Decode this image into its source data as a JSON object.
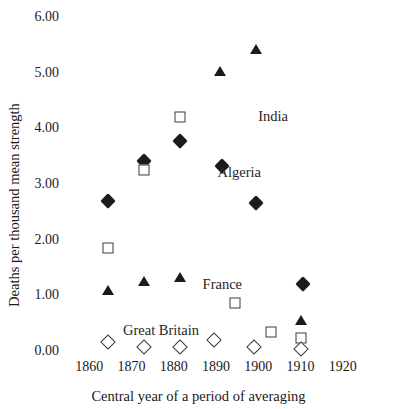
{
  "figure": {
    "title_remnant": "",
    "background_color": "#ffffff",
    "marker_color": "#1b1b1b",
    "outline_color": "#3a3a3a"
  },
  "chart_data": {
    "type": "scatter",
    "title": "",
    "xlabel": "Central year of a period of averaging",
    "ylabel": "Deaths per thousand mean strength",
    "xlim": [
      1855,
      1925
    ],
    "ylim": [
      0.0,
      6.0
    ],
    "grid": false,
    "legend_position": "inline-annotations",
    "xticks": [
      "1860",
      "1870",
      "1880",
      "1890",
      "1900",
      "1910",
      "1920"
    ],
    "xtick_values": [
      1860,
      1870,
      1880,
      1890,
      1900,
      1910,
      1920
    ],
    "yticks": [
      "0.00",
      "1.00",
      "2.00",
      "3.00",
      "4.00",
      "5.00",
      "6.00"
    ],
    "ytick_values": [
      0.0,
      1.0,
      2.0,
      3.0,
      4.0,
      5.0,
      6.0
    ],
    "series": [
      {
        "name": "India",
        "marker": "filled-triangle",
        "label_text": "India",
        "label_x": 1903.5,
        "label_y": 4.23,
        "points": [
          {
            "x": 1864.5,
            "y": 1.1
          },
          {
            "x": 1873.0,
            "y": 1.26
          },
          {
            "x": 1881.5,
            "y": 1.33
          },
          {
            "x": 1891.0,
            "y": 5.03
          },
          {
            "x": 1899.5,
            "y": 5.43
          },
          {
            "x": 1910.0,
            "y": 0.55
          }
        ]
      },
      {
        "name": "Algeria",
        "marker": "filled-diamond",
        "label_text": "Algeria",
        "label_x": 1895.5,
        "label_y": 3.22,
        "points": [
          {
            "x": 1864.5,
            "y": 2.69
          },
          {
            "x": 1873.0,
            "y": 3.42
          },
          {
            "x": 1881.5,
            "y": 3.77
          },
          {
            "x": 1891.5,
            "y": 3.32
          },
          {
            "x": 1899.5,
            "y": 2.66
          },
          {
            "x": 1910.5,
            "y": 1.21
          }
        ]
      },
      {
        "name": "France",
        "marker": "open-square",
        "label_text": "France",
        "label_x": 1891.5,
        "label_y": 1.21,
        "points": [
          {
            "x": 1864.5,
            "y": 1.85
          },
          {
            "x": 1873.0,
            "y": 3.25
          },
          {
            "x": 1881.5,
            "y": 4.2
          },
          {
            "x": 1894.5,
            "y": 0.86
          },
          {
            "x": 1903.0,
            "y": 0.35
          },
          {
            "x": 1910.0,
            "y": 0.24
          }
        ]
      },
      {
        "name": "Great Britain",
        "marker": "open-diamond",
        "label_text": "Great Britain",
        "label_x": 1877.0,
        "label_y": 0.38,
        "points": [
          {
            "x": 1864.5,
            "y": 0.17
          },
          {
            "x": 1873.0,
            "y": 0.08
          },
          {
            "x": 1881.5,
            "y": 0.08
          },
          {
            "x": 1889.5,
            "y": 0.2
          },
          {
            "x": 1899.0,
            "y": 0.07
          },
          {
            "x": 1910.0,
            "y": 0.04
          }
        ]
      }
    ]
  }
}
